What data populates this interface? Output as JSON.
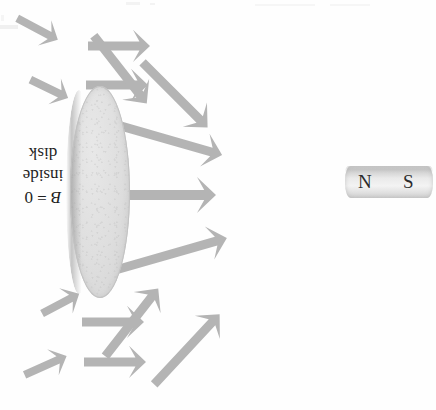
{
  "figure": {
    "kind": "physics-diagram",
    "width": 436,
    "height": 410,
    "background_color": "#fefefe",
    "orientation_note": "page scanned upside-down; caption text appears rotated 180 degrees"
  },
  "caption": {
    "line1_symbol": "B",
    "line1_rest": " = 0",
    "line2": "inside",
    "line3": "disk",
    "full_text": "B = 0 inside disk",
    "color": "#1e1e1e"
  },
  "magnet": {
    "name": "bar-magnet",
    "north_label": "N",
    "south_label": "S",
    "body_color": "#e4e4e4",
    "label_color": "#2b2b2b"
  },
  "disk": {
    "name": "superconducting-disk",
    "fill_color": "#dedede",
    "edge_color": "#c2c2c2"
  },
  "arrows": {
    "color": "#b4b4b4",
    "count": 14,
    "items": [
      {
        "id": "arrow-1",
        "x": 150,
        "y": 36,
        "angle": 180,
        "length": 62,
        "thickness": 9,
        "head": 17
      },
      {
        "id": "arrow-2",
        "x": 62,
        "y": 32,
        "angle": 208,
        "length": 46,
        "thickness": 8,
        "head": 15
      },
      {
        "id": "arrow-3",
        "x": 148,
        "y": 75,
        "angle": 180,
        "length": 62,
        "thickness": 9,
        "head": 17
      },
      {
        "id": "arrow-4",
        "x": 72,
        "y": 90,
        "angle": 206,
        "length": 42,
        "thickness": 8,
        "head": 15
      },
      {
        "id": "arrow-5",
        "x": 225,
        "y": 145,
        "angle": 196,
        "length": 124,
        "thickness": 9,
        "head": 18
      },
      {
        "id": "arrow-6",
        "x": 216,
        "y": 184,
        "angle": 180,
        "length": 137,
        "thickness": 10,
        "head": 19
      },
      {
        "id": "arrow-7",
        "x": 224,
        "y": 228,
        "angle": 164,
        "length": 124,
        "thickness": 9,
        "head": 18
      },
      {
        "id": "arrow-8",
        "x": 215,
        "y": 120,
        "angle": 225,
        "length": 92,
        "thickness": 9,
        "head": 18
      },
      {
        "id": "arrow-9",
        "x": 155,
        "y": 97,
        "angle": 232,
        "length": 86,
        "thickness": 9,
        "head": 18
      },
      {
        "id": "arrow-10",
        "x": 150,
        "y": 282,
        "angle": 128,
        "length": 86,
        "thickness": 9,
        "head": 18
      },
      {
        "id": "arrow-11",
        "x": 212,
        "y": 307,
        "angle": 133,
        "length": 96,
        "thickness": 9,
        "head": 18
      },
      {
        "id": "arrow-12",
        "x": 75,
        "y": 286,
        "angle": 152,
        "length": 42,
        "thickness": 8,
        "head": 15
      },
      {
        "id": "arrow-13",
        "x": 144,
        "y": 312,
        "angle": 180,
        "length": 62,
        "thickness": 9,
        "head": 17
      },
      {
        "id": "arrow-14",
        "x": 63,
        "y": 348,
        "angle": 156,
        "length": 46,
        "thickness": 8,
        "head": 15
      },
      {
        "id": "arrow-15",
        "x": 146,
        "y": 352,
        "angle": 180,
        "length": 62,
        "thickness": 9,
        "head": 17
      }
    ]
  }
}
